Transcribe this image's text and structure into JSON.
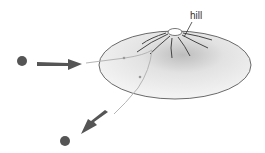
{
  "diagram": {
    "labels": {
      "hill": "hill"
    },
    "colors": {
      "particle": "#555555",
      "arrow": "#555555",
      "surface_fill": "#efefef",
      "surface_shade": "#c8c8c8",
      "outline": "#666666",
      "path": "#aaaaaa",
      "contour": "#444444"
    },
    "elements": [
      {
        "type": "particle",
        "role": "incoming"
      },
      {
        "type": "arrow",
        "role": "incoming-direction"
      },
      {
        "type": "surface",
        "role": "potential-hill"
      },
      {
        "type": "trajectory",
        "role": "deflected-path"
      },
      {
        "type": "arrow",
        "role": "outgoing-direction"
      },
      {
        "type": "particle",
        "role": "outgoing"
      }
    ]
  }
}
